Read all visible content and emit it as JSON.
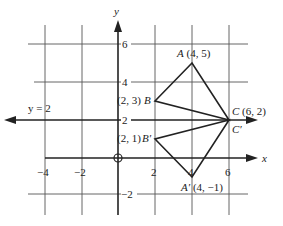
{
  "diagram": {
    "axes": {
      "x_label": "x",
      "y_label": "y",
      "x_ticks": [
        "−4",
        "−2",
        "2",
        "4",
        "6"
      ],
      "y_ticks": [
        "6",
        "4",
        "2",
        "−2"
      ],
      "origin_marker": "circle"
    },
    "line_label": "y = 2",
    "points": {
      "A": {
        "name": "A",
        "coords": "(4, 5)"
      },
      "B": {
        "name": "B",
        "coords": "(2, 3)"
      },
      "C": {
        "name": "C",
        "coords": "(6, 2)"
      },
      "A_prime": {
        "name": "A′",
        "coords": "(4, −1)"
      },
      "B_prime": {
        "name": "B′",
        "coords": "(2, 1)"
      },
      "C_prime": {
        "name": "C′"
      }
    },
    "triangles": [
      {
        "name": "ABC",
        "vertices": [
          [
            4,
            5
          ],
          [
            2,
            3
          ],
          [
            6,
            2
          ]
        ]
      },
      {
        "name": "A'B'C'",
        "vertices": [
          [
            4,
            -1
          ],
          [
            2,
            1
          ],
          [
            6,
            2
          ]
        ]
      }
    ],
    "reflection_line": "y = 2"
  }
}
